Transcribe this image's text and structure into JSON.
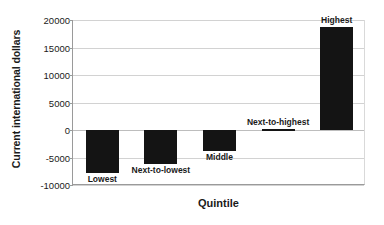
{
  "chart_data": {
    "type": "bar",
    "title": "",
    "xlabel": "Quintile",
    "ylabel": "Current international dollars",
    "categories": [
      "Lowest",
      "Next-to-lowest",
      "Middle",
      "Next-to-highest",
      "Highest"
    ],
    "values": [
      -7900,
      -6200,
      -3800,
      200,
      18800
    ],
    "ylim": [
      -10000,
      20000
    ],
    "yticks": [
      20000,
      15000,
      10000,
      5000,
      0,
      -5000,
      -10000
    ],
    "ytick_labels": [
      "20000",
      "15000",
      "10000",
      "5000",
      "0",
      "-5000",
      "-10000"
    ],
    "grid": true,
    "legend": false,
    "bar_color": "#141414",
    "grid_color": "#d2d2d2",
    "axis_color": "#9a9a9a",
    "text_color": "#1a1a1a"
  }
}
